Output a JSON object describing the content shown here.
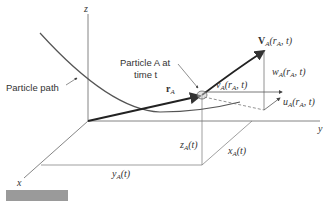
{
  "diagram": {
    "type": "3d-particle-velocity",
    "axes": {
      "x_label": "x",
      "y_label": "y",
      "z_label": "z"
    },
    "labels": {
      "particle_path": "Particle path",
      "particle_line1": "Particle A at",
      "particle_line2": "time t",
      "position_vector": "r",
      "position_vector_sub": "A",
      "velocity": "V",
      "velocity_sub": "A",
      "velocity_args": "(r",
      "velocity_args_sub": "A",
      "velocity_args_end": ", t)",
      "u_comp": "u",
      "u_sub": "A",
      "v_comp": "v",
      "v_sub": "A",
      "w_comp": "w",
      "w_sub": "A",
      "comp_args": "(r",
      "comp_args_sub": "A",
      "comp_args_end": ", t)",
      "x_coord": "x",
      "x_coord_sub": "A",
      "y_coord": "y",
      "y_coord_sub": "A",
      "z_coord": "z",
      "z_coord_sub": "A",
      "coord_arg": "(t)"
    },
    "colors": {
      "line": "#555555",
      "vector": "#222222",
      "figure_bar": "#9a9a9a"
    }
  }
}
